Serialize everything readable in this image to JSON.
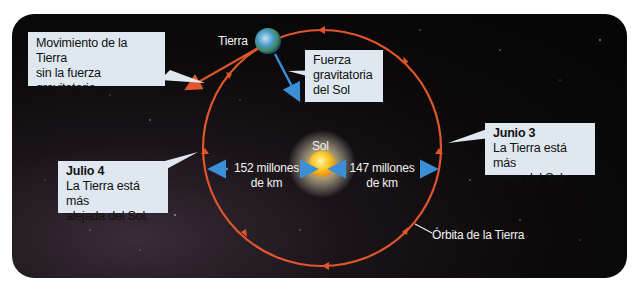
{
  "diagram": {
    "title_labels": {
      "earth": "Tierra",
      "sun": "Sol",
      "orbit": "Órbita de la Tierra"
    },
    "callouts": {
      "motion_without_gravity": {
        "line1": "Movimiento de la Tierra",
        "line2": "sin la fuerza gravitatoria",
        "line3": "del Sol"
      },
      "gravity_force": {
        "line1": "Fuerza",
        "line2": "gravitatoria",
        "line3": "del Sol"
      },
      "june": {
        "heading": "Junio 3",
        "line1": "La Tierra está más",
        "line2": "cerca del Sol."
      },
      "july": {
        "heading": "Julio 4",
        "line1": "La Tierra está más",
        "line2": "alejada del Sol."
      }
    },
    "distances": {
      "aphelion": {
        "line1": "152 millones",
        "line2": "de km"
      },
      "perihelion": {
        "line1": "147 millones",
        "line2": "de km"
      }
    },
    "colors": {
      "orbit": "#e0562c",
      "arrow_blue": "#3a8fd6",
      "callout_bg": "#dfe8f0",
      "background": "#0b0909",
      "sun": "#f7c21c"
    }
  }
}
